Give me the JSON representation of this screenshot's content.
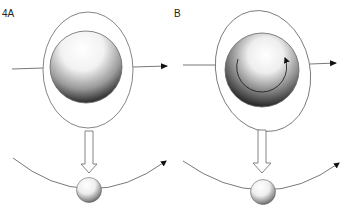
{
  "figure": {
    "panels": [
      {
        "id": "A",
        "label": "4A",
        "description": "Sphere inside outer shell with straight trajectory; hollow arrow points down to small ball on curved path"
      },
      {
        "id": "B",
        "label": "B",
        "description": "Sphere inside tilted outer shell with rotation arrow; hollow arrow points down to small ball on curved path"
      }
    ],
    "colors": {
      "line": "#555555",
      "arrowhead": "#111111",
      "sphere_light": "#ffffff",
      "sphere_dark": "#1a1a1a",
      "background": "#ffffff"
    }
  }
}
